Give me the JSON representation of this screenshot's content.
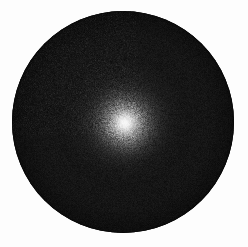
{
  "image": {
    "kind": "grayscale-astronomical-disk",
    "width": 248,
    "height": 247,
    "background_color": "#fdfdfd",
    "caption": ""
  },
  "disk": {
    "name": "dark-circular-disk",
    "center_x": 123,
    "center_y": 122,
    "radius": 111,
    "left": 13,
    "top": 10,
    "diameter": 222,
    "fill_color": "#121212",
    "edge_color": "#050505",
    "rim_softness_px": 2
  },
  "glow": {
    "name": "central-bright-source",
    "center_x": 125,
    "center_y": 123,
    "peak_color": "#f2f2f2",
    "core_radius": 12,
    "mid_radius": 26,
    "halo_radius": 42,
    "outer_radius": 62,
    "falloff": "gaussian"
  },
  "grain": {
    "name": "sensor-noise",
    "enabled": true,
    "intensity": 0.62,
    "scale_px": 1,
    "monochrome": true
  },
  "chart_data": {
    "type": "heatmap",
    "title": "",
    "xlabel": "",
    "ylabel": "",
    "colormap": "grayscale",
    "value_range": [
      0,
      255
    ],
    "radial_profile": {
      "radius_px": [
        0,
        5,
        10,
        15,
        20,
        25,
        30,
        35,
        40,
        50,
        60,
        70,
        85,
        100,
        111
      ],
      "intensity": [
        240,
        232,
        208,
        176,
        140,
        108,
        80,
        58,
        42,
        28,
        22,
        19,
        17,
        14,
        8
      ]
    }
  }
}
